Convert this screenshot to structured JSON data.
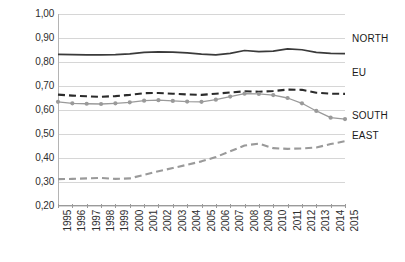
{
  "chart_data": {
    "type": "line",
    "title": "",
    "xlabel": "",
    "ylabel": "",
    "ylim": [
      0.2,
      1.0
    ],
    "ytick_step": 0.1,
    "ytick_labels": [
      "1,00",
      "0,90",
      "0,80",
      "0,70",
      "0,60",
      "0,50",
      "0,40",
      "0,30",
      "0,20"
    ],
    "ytick_values": [
      1.0,
      0.9,
      0.8,
      0.7,
      0.6,
      0.5,
      0.4,
      0.3,
      0.2
    ],
    "decimal_separator": ",",
    "grid": "horizontal",
    "legend_position": "right-inline",
    "categories": [
      "1995",
      "1996",
      "1997",
      "1998",
      "1999",
      "2000",
      "2001",
      "2002",
      "2003",
      "2004",
      "2005",
      "2006",
      "2007",
      "2008",
      "2009",
      "2010",
      "2011",
      "2012",
      "2013",
      "2014",
      "2015"
    ],
    "x": [
      1995,
      1996,
      1997,
      1998,
      1999,
      2000,
      2001,
      2002,
      2003,
      2004,
      2005,
      2006,
      2007,
      2008,
      2009,
      2010,
      2011,
      2012,
      2013,
      2014,
      2015
    ],
    "series": [
      {
        "name": "NORTH",
        "style": "solid",
        "color": "#3a3a3a",
        "markers": false,
        "values": [
          0.832,
          0.831,
          0.83,
          0.83,
          0.831,
          0.834,
          0.84,
          0.842,
          0.841,
          0.838,
          0.833,
          0.83,
          0.836,
          0.848,
          0.843,
          0.845,
          0.855,
          0.851,
          0.84,
          0.836,
          0.835
        ]
      },
      {
        "name": "EU",
        "style": "dashed",
        "color": "#2b2b2b",
        "markers": false,
        "values": [
          0.664,
          0.66,
          0.657,
          0.655,
          0.658,
          0.663,
          0.67,
          0.671,
          0.668,
          0.665,
          0.663,
          0.668,
          0.673,
          0.678,
          0.676,
          0.679,
          0.685,
          0.684,
          0.672,
          0.668,
          0.667
        ]
      },
      {
        "name": "SOUTH",
        "style": "solid",
        "color": "#9a9a9a",
        "markers": true,
        "values": [
          0.634,
          0.628,
          0.626,
          0.625,
          0.628,
          0.632,
          0.639,
          0.641,
          0.638,
          0.635,
          0.634,
          0.643,
          0.656,
          0.668,
          0.667,
          0.662,
          0.65,
          0.628,
          0.596,
          0.568,
          0.562
        ]
      },
      {
        "name": "EAST",
        "style": "dashed",
        "color": "#9a9a9a",
        "markers": false,
        "values": [
          0.312,
          0.313,
          0.315,
          0.317,
          0.313,
          0.315,
          0.33,
          0.345,
          0.358,
          0.372,
          0.386,
          0.404,
          0.428,
          0.452,
          0.46,
          0.441,
          0.438,
          0.44,
          0.444,
          0.458,
          0.47
        ]
      }
    ],
    "annotations": [
      {
        "text": "NORTH",
        "series": "NORTH"
      },
      {
        "text": "EU",
        "series": "EU"
      },
      {
        "text": "SOUTH",
        "series": "SOUTH"
      },
      {
        "text": "EAST",
        "series": "EAST"
      }
    ],
    "colors": {
      "north": "#3a3a3a",
      "eu": "#2b2b2b",
      "south": "#9a9a9a",
      "east": "#9a9a9a",
      "grid": "#d6d6d6",
      "axis": "#9a9a9a",
      "text": "#2e2e2e",
      "background": "#ffffff"
    }
  }
}
